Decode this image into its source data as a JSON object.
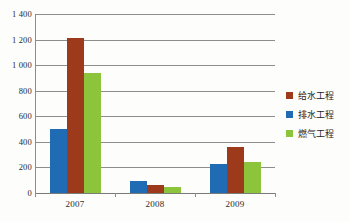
{
  "chart_data": {
    "type": "bar",
    "title": "",
    "xlabel": "",
    "ylabel": "",
    "categories": [
      "2007",
      "2008",
      "2009"
    ],
    "series": [
      {
        "name": "给水工程",
        "color": "#9c3a1b",
        "values": [
          1210,
          62,
          360
        ]
      },
      {
        "name": "排水工程",
        "color": "#1f6cb4",
        "values": [
          500,
          95,
          230
        ]
      },
      {
        "name": "燃气工程",
        "color": "#8cc43c",
        "values": [
          935,
          47,
          243
        ]
      }
    ],
    "series_draw_order": [
      "排水工程",
      "给水工程",
      "燃气工程"
    ],
    "ylim": [
      0,
      1400
    ],
    "ytick_labels": [
      "1 400",
      "1 200",
      "1 000",
      "800",
      "600",
      "400",
      "200",
      "0"
    ],
    "ytick_values": [
      1400,
      1200,
      1000,
      800,
      600,
      400,
      200,
      0
    ],
    "grid": true,
    "legend_position": "right"
  },
  "legend": {
    "items": [
      {
        "label": "给水工程",
        "swatch": "s-red"
      },
      {
        "label": "排水工程",
        "swatch": "s-blue"
      },
      {
        "label": "燃气工程",
        "swatch": "s-green"
      }
    ]
  },
  "axes": {
    "y_ticks": [
      {
        "label": "1 400",
        "value": 1400
      },
      {
        "label": "1 200",
        "value": 1200
      },
      {
        "label": "1 000",
        "value": 1000
      },
      {
        "label": "800",
        "value": 800
      },
      {
        "label": "600",
        "value": 600
      },
      {
        "label": "400",
        "value": 400
      },
      {
        "label": "200",
        "value": 200
      },
      {
        "label": "0",
        "value": 0
      }
    ],
    "x_categories": [
      "2007",
      "2008",
      "2009"
    ]
  }
}
